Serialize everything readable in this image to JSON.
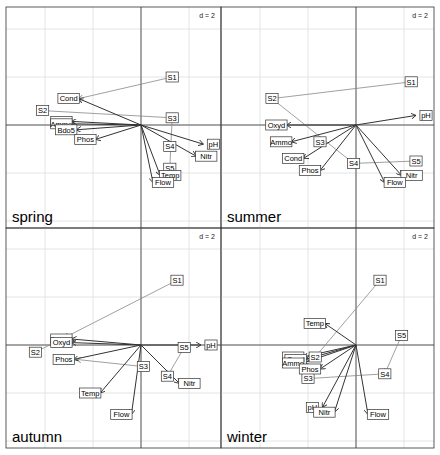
{
  "chart_data": {
    "type": "scatter",
    "scale_label": "d = 2",
    "layout": {
      "rows": 2,
      "cols": 2,
      "grid": true
    },
    "panels": [
      {
        "season": "spring",
        "scale_label": "d = 2",
        "variables": [
          {
            "name": "Cond",
            "x": -2.6,
            "y": 1.1
          },
          {
            "name": "Oxyd",
            "x": -2.9,
            "y": 0.15
          },
          {
            "name": "Ammo",
            "x": -2.9,
            "y": 0.05
          },
          {
            "name": "Bdo5",
            "x": -2.7,
            "y": -0.2
          },
          {
            "name": "Phos",
            "x": -1.9,
            "y": -0.6
          },
          {
            "name": "pH",
            "x": 2.6,
            "y": -0.8
          },
          {
            "name": "Nitr",
            "x": 2.3,
            "y": -1.3
          },
          {
            "name": "Temp",
            "x": 0.8,
            "y": -2.1
          },
          {
            "name": "Flow",
            "x": 0.5,
            "y": -2.4
          }
        ],
        "sites": [
          {
            "name": "S1",
            "from": [
              1.3,
              2.0
            ],
            "to": [
              -2.6,
              1.1
            ]
          },
          {
            "name": "S2",
            "from": [
              -4.1,
              0.6
            ],
            "to": [
              1.3,
              0.3
            ]
          },
          {
            "name": "S3",
            "from": [
              1.3,
              0.3
            ],
            "to": [
              1.2,
              -1.8
            ]
          },
          {
            "name": "S4",
            "from": [
              1.2,
              -0.9
            ],
            "to": [
              1.2,
              -0.9
            ]
          },
          {
            "name": "S5",
            "from": [
              1.2,
              -1.8
            ],
            "to": [
              1.2,
              -1.8
            ]
          }
        ]
      },
      {
        "season": "summer",
        "scale_label": "d = 2",
        "variables": [
          {
            "name": "Oxyd",
            "x": -2.9,
            "y": 0.0
          },
          {
            "name": "Ammo",
            "x": -2.7,
            "y": -0.7
          },
          {
            "name": "Cond",
            "x": -2.2,
            "y": -1.4
          },
          {
            "name": "Phos",
            "x": -1.5,
            "y": -1.9
          },
          {
            "name": "pH",
            "x": 2.5,
            "y": 0.4
          },
          {
            "name": "Nitr",
            "x": 1.9,
            "y": -2.1
          },
          {
            "name": "Flow",
            "x": 1.2,
            "y": -2.4
          }
        ],
        "sites": [
          {
            "name": "S1",
            "from": [
              2.3,
              1.8
            ],
            "to": [
              -3.5,
              1.1
            ]
          },
          {
            "name": "S2",
            "from": [
              -3.5,
              1.1
            ],
            "to": [
              -0.1,
              -1.6
            ]
          },
          {
            "name": "S3",
            "from": [
              -1.5,
              -0.7
            ],
            "to": [
              -1.5,
              -0.7
            ]
          },
          {
            "name": "S4",
            "from": [
              -0.1,
              -1.6
            ],
            "to": [
              -0.1,
              -1.6
            ]
          },
          {
            "name": "S5",
            "from": [
              2.5,
              -1.5
            ],
            "to": [
              -0.1,
              -1.6
            ]
          }
        ]
      },
      {
        "season": "autumn",
        "scale_label": "d = 2",
        "variables": [
          {
            "name": "Ammo",
            "x": -2.9,
            "y": 0.25
          },
          {
            "name": "Oxyd",
            "x": -2.9,
            "y": 0.1
          },
          {
            "name": "Phos",
            "x": -2.8,
            "y": -0.6
          },
          {
            "name": "pH",
            "x": 2.5,
            "y": 0.0
          },
          {
            "name": "Nitr",
            "x": 1.6,
            "y": -1.6
          },
          {
            "name": "Temp",
            "x": -1.7,
            "y": -2.0
          },
          {
            "name": "Flow",
            "x": -0.4,
            "y": -2.9
          }
        ],
        "sites": [
          {
            "name": "S1",
            "from": [
              1.5,
              2.7
            ],
            "to": [
              -3.2,
              0.3
            ]
          },
          {
            "name": "S2",
            "from": [
              -4.4,
              -0.3
            ],
            "to": [
              -3.2,
              0.3
            ]
          },
          {
            "name": "S3",
            "from": [
              0.1,
              -0.9
            ],
            "to": [
              -2.7,
              -0.6
            ]
          },
          {
            "name": "S4",
            "from": [
              1.1,
              -1.3
            ],
            "to": [
              1.1,
              -1.3
            ]
          },
          {
            "name": "S5",
            "from": [
              1.8,
              -0.1
            ],
            "to": [
              1.1,
              -1.3
            ]
          }
        ]
      },
      {
        "season": "winter",
        "scale_label": "d = 2",
        "variables": [
          {
            "name": "Temp",
            "x": -1.3,
            "y": 0.9
          },
          {
            "name": "Oxyd",
            "x": -2.2,
            "y": -0.5
          },
          {
            "name": "Cond",
            "x": -2.1,
            "y": -0.6
          },
          {
            "name": "Ammo",
            "x": -2.2,
            "y": -0.75
          },
          {
            "name": "Phos",
            "x": -1.5,
            "y": -1.0
          },
          {
            "name": "pH",
            "x": -1.4,
            "y": -2.6
          },
          {
            "name": "Nitr",
            "x": -0.9,
            "y": -2.8
          },
          {
            "name": "Flow",
            "x": 0.5,
            "y": -2.9
          }
        ],
        "sites": [
          {
            "name": "S1",
            "from": [
              1.0,
              2.7
            ],
            "to": [
              -1.7,
              -0.5
            ]
          },
          {
            "name": "S2",
            "from": [
              -1.7,
              -0.5
            ],
            "to": [
              -1.7,
              -0.5
            ]
          },
          {
            "name": "S3",
            "from": [
              -2.0,
              -1.4
            ],
            "to": [
              -2.0,
              -1.4
            ]
          },
          {
            "name": "S4",
            "from": [
              1.2,
              -1.2
            ],
            "to": [
              -2.0,
              -1.4
            ]
          },
          {
            "name": "S5",
            "from": [
              1.9,
              0.4
            ],
            "to": [
              1.2,
              -1.2
            ]
          }
        ]
      }
    ],
    "xlim": [
      -6,
      4.5
    ],
    "ylim": [
      -4.5,
      6
    ]
  }
}
